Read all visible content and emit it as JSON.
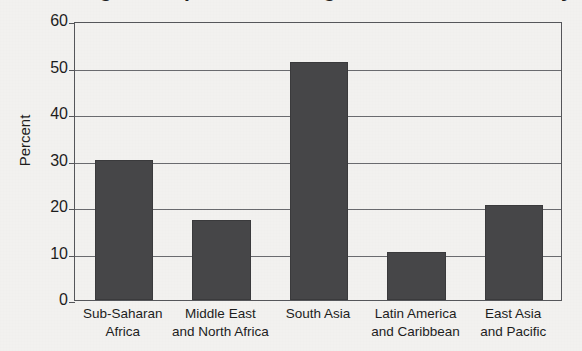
{
  "chart_data": {
    "type": "bar",
    "title": "Percentage of Population Living on Less Than $1 a Day",
    "subtitle": "",
    "xlabel": "",
    "ylabel": "Percent",
    "categories": [
      "Sub-Saharan Africa",
      "Middle East and North Africa",
      "South Asia",
      "Latin America and Caribbean",
      "East Asia and Pacific"
    ],
    "category_lines": [
      [
        "Sub-Saharan",
        "Africa"
      ],
      [
        "Middle East",
        "and North Africa"
      ],
      [
        "South Asia",
        ""
      ],
      [
        "Latin America",
        "and Caribbean"
      ],
      [
        "East Asia",
        "and Pacific"
      ]
    ],
    "values": [
      30.2,
      17.2,
      51.2,
      10.3,
      20.5
    ],
    "ylim": [
      0,
      60
    ],
    "yticks": [
      0,
      10,
      20,
      30,
      40,
      50,
      60
    ],
    "ytick_labels": [
      "0",
      "10",
      "20",
      "30",
      "40",
      "50",
      "60"
    ],
    "grid": true,
    "legend": false,
    "legend_position": "none",
    "bar_color": "#464648",
    "plot_border_color": "#55565a",
    "gridline_color": "#6a6b6f",
    "background_color": "#f2f1ef",
    "text_color": "#1d1d1d"
  }
}
